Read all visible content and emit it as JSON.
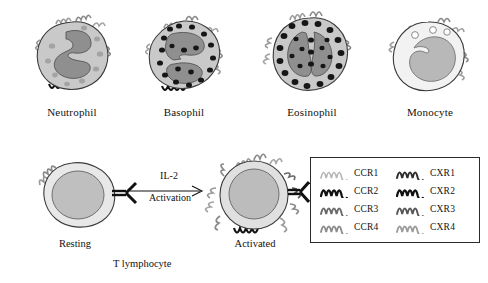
{
  "figure": {
    "background_color": "#ffffff",
    "cells": [
      {
        "id": "neutrophil",
        "label": "Neutrophil",
        "cytoplasm_color": "#c9c9c9",
        "nucleus_color": "#8f8f8f",
        "granule_color": "#a0a0a0",
        "nucleus_shape": "multilobed",
        "receptors": [
          "CCR1",
          "CCR3",
          "CXR1",
          "CXR2"
        ]
      },
      {
        "id": "basophil",
        "label": "Basophil",
        "cytoplasm_color": "#c9c9c9",
        "nucleus_color": "#8f8f8f",
        "granule_color": "#1c1c1c",
        "nucleus_shape": "bilobed",
        "receptors": [
          "CCR2",
          "CCR3",
          "CXR2"
        ]
      },
      {
        "id": "eosinophil",
        "label": "Eosinophil",
        "cytoplasm_color": "#c9c9c9",
        "nucleus_color": "#8f8f8f",
        "granule_color": "#1c1c1c",
        "nucleus_shape": "bilobed",
        "receptors": [
          "CCR1",
          "CCR3",
          "CXR1"
        ]
      },
      {
        "id": "monocyte",
        "label": "Monocyte",
        "cytoplasm_color": "#f2f2f2",
        "nucleus_color": "#b8b8b8",
        "granule_color": "#ffffff",
        "nucleus_shape": "kidney",
        "receptors": [
          "CCR2",
          "CXR2",
          "CXR4"
        ]
      }
    ],
    "lymphocyte": {
      "caption": "T lymphocyte",
      "resting": {
        "label": "Resting",
        "cytoplasm_color": "#e8e8e8",
        "nucleus_color": "#bfbfbf"
      },
      "activated": {
        "label": "Activated",
        "cytoplasm_color": "#e0e0e0",
        "nucleus_color": "#bcbcbc"
      },
      "arrow": {
        "above_label": "IL-2",
        "below_label": "Activation",
        "direction": "right"
      },
      "tcr_color": "#111111"
    },
    "legend": {
      "border_color": "#2a2a2a",
      "entries": [
        {
          "label": "CCR1",
          "color": "#b5b5b5"
        },
        {
          "label": "CXR1",
          "color": "#2e2e2e"
        },
        {
          "label": "CCR2",
          "color": "#111111"
        },
        {
          "label": "CXR2",
          "color": "#111111"
        },
        {
          "label": "CCR3",
          "color": "#6a6a6a"
        },
        {
          "label": "CXR3",
          "color": "#555555"
        },
        {
          "label": "CCR4",
          "color": "#8c8c8c"
        },
        {
          "label": "CXR4",
          "color": "#9a9a9a"
        }
      ]
    }
  }
}
